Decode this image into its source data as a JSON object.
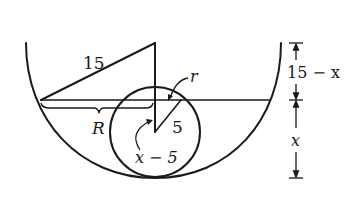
{
  "diagram": {
    "colors": {
      "stroke": "#1a1a1a",
      "background": "#ffffff"
    },
    "labels": {
      "hypotenuse": "15",
      "water_radius": "R",
      "ball_radius": "5",
      "waterline_circle_radius": "r",
      "ball_center_depth": "x − 5",
      "upper_dimension": "15 − x",
      "lower_dimension": "x"
    }
  }
}
